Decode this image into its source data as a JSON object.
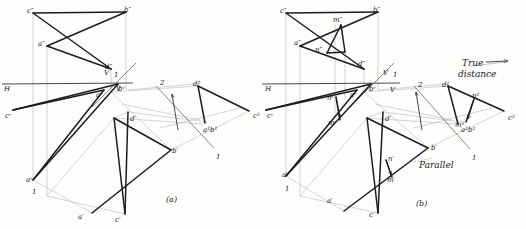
{
  "drawing": {
    "title": "Orthographic projection - shortest distance between two skew lines",
    "colors": {
      "object_line": "#1c1c1c",
      "construction_line": "#b9b9b9",
      "reference_line": "#555555",
      "paper": "#fdfdfc"
    },
    "figures": [
      {
        "id": "a",
        "caption": "(a)",
        "caption_pos": {
          "x": 166,
          "y": 196
        },
        "ground_line_labels": [
          {
            "text": "H",
            "x": 4,
            "y": 86
          },
          {
            "text": "V",
            "x": 104,
            "y": 70
          },
          {
            "text": "1",
            "x": 114,
            "y": 72
          },
          {
            "text": "V",
            "x": 116,
            "y": 86
          }
        ],
        "aux_labels": [
          {
            "text": "2",
            "x": 160,
            "y": 80
          },
          {
            "text": "1",
            "x": 216,
            "y": 154
          }
        ],
        "points": [
          {
            "text": "c″",
            "x": 27,
            "y": 8
          },
          {
            "text": "b″",
            "x": 124,
            "y": 7
          },
          {
            "text": "a″",
            "x": 38,
            "y": 41
          },
          {
            "text": "d″",
            "x": 105,
            "y": 64
          },
          {
            "text": "aᵛ",
            "x": 96,
            "y": 92
          },
          {
            "text": "bᵛ",
            "x": 118,
            "y": 86
          },
          {
            "text": "cᵛ",
            "x": 5,
            "y": 113
          },
          {
            "text": "aᵛ",
            "x": 26,
            "y": 177
          },
          {
            "text": "1",
            "x": 32,
            "y": 189
          },
          {
            "text": "d′",
            "x": 130,
            "y": 116
          },
          {
            "text": "b′",
            "x": 172,
            "y": 148
          },
          {
            "text": "a′",
            "x": 78,
            "y": 214
          },
          {
            "text": "c′",
            "x": 115,
            "y": 217
          },
          {
            "text": "d²",
            "x": 193,
            "y": 81
          },
          {
            "text": "c²",
            "x": 253,
            "y": 113
          },
          {
            "text": "a²b²",
            "x": 203,
            "y": 127
          }
        ]
      },
      {
        "id": "b",
        "caption": "(b)",
        "caption_pos": {
          "x": 416,
          "y": 200
        },
        "ground_line_labels": [
          {
            "text": "H",
            "x": 265,
            "y": 86
          },
          {
            "text": "V",
            "x": 383,
            "y": 70
          },
          {
            "text": "1",
            "x": 393,
            "y": 72
          },
          {
            "text": "V",
            "x": 390,
            "y": 87
          }
        ],
        "aux_labels": [
          {
            "text": "2",
            "x": 418,
            "y": 82
          },
          {
            "text": "1",
            "x": 472,
            "y": 155
          }
        ],
        "annotations": [
          {
            "text": "True",
            "x": 462,
            "y": 59
          },
          {
            "text": "distance",
            "x": 458,
            "y": 70
          },
          {
            "text": "Parallel",
            "x": 419,
            "y": 161
          }
        ],
        "points": [
          {
            "text": "c″",
            "x": 280,
            "y": 8
          },
          {
            "text": "b″",
            "x": 373,
            "y": 7
          },
          {
            "text": "m″",
            "x": 333,
            "y": 17
          },
          {
            "text": "a″",
            "x": 294,
            "y": 40
          },
          {
            "text": "n″",
            "x": 315,
            "y": 47
          },
          {
            "text": "d″",
            "x": 358,
            "y": 61
          },
          {
            "text": "nᵛ",
            "x": 327,
            "y": 95
          },
          {
            "text": "aᵛ",
            "x": 350,
            "y": 92
          },
          {
            "text": "bᵛ",
            "x": 369,
            "y": 86
          },
          {
            "text": "mᵛ",
            "x": 328,
            "y": 120
          },
          {
            "text": "cᵛ",
            "x": 267,
            "y": 113
          },
          {
            "text": "aᵛ",
            "x": 282,
            "y": 172
          },
          {
            "text": "1",
            "x": 285,
            "y": 186
          },
          {
            "text": "d′",
            "x": 385,
            "y": 116
          },
          {
            "text": "b′",
            "x": 431,
            "y": 145
          },
          {
            "text": "n′",
            "x": 388,
            "y": 156
          },
          {
            "text": "m′",
            "x": 387,
            "y": 177
          },
          {
            "text": "a′",
            "x": 327,
            "y": 198
          },
          {
            "text": "c′",
            "x": 369,
            "y": 212
          },
          {
            "text": "d²",
            "x": 442,
            "y": 82
          },
          {
            "text": "n²",
            "x": 472,
            "y": 93
          },
          {
            "text": "m²",
            "x": 455,
            "y": 122
          },
          {
            "text": "a²b²",
            "x": 461,
            "y": 127
          },
          {
            "text": "c²",
            "x": 508,
            "y": 115
          }
        ]
      }
    ]
  }
}
